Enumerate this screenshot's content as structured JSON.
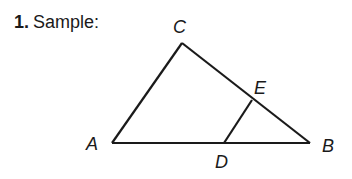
{
  "problem": {
    "number": "1.",
    "label": "Sample:"
  },
  "figure": {
    "type": "triangle-with-segment",
    "stroke_color": "#1a1a1a",
    "vertices": {
      "A": {
        "label": "A",
        "x": 112,
        "y": 143
      },
      "B": {
        "label": "B",
        "x": 310,
        "y": 143
      },
      "C": {
        "label": "C",
        "x": 182,
        "y": 43
      },
      "D": {
        "label": "D",
        "x": 224,
        "y": 143
      },
      "E": {
        "label": "E",
        "x": 252,
        "y": 100
      }
    },
    "segments": [
      "AB",
      "BC",
      "CA",
      "DE"
    ],
    "labels": {
      "A": "A",
      "B": "B",
      "C": "C",
      "D": "D",
      "E": "E"
    }
  }
}
